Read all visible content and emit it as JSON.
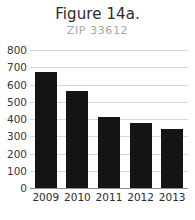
{
  "chart_data": {
    "type": "bar",
    "title": "Figure 14a.",
    "subtitle": "ZIP 33612",
    "categories": [
      "2009",
      "2010",
      "2011",
      "2012",
      "2013"
    ],
    "values": [
      670,
      560,
      410,
      375,
      340
    ],
    "xlabel": "",
    "ylabel": "",
    "ylim": [
      0,
      800
    ],
    "ytick_step": 100,
    "yticks": [
      "800",
      "700",
      "600",
      "500",
      "400",
      "300",
      "200",
      "100",
      "0"
    ],
    "grid": true,
    "legend": false,
    "series": [
      {
        "name": "ZIP 33612",
        "values": [
          670,
          560,
          410,
          375,
          340
        ]
      }
    ],
    "colors": {
      "bar": "#141414",
      "gridline": "#d8d8d8",
      "baseline": "#8f8f8f",
      "title": "#2b2b2b",
      "subtitle": "#a6a6a6",
      "tick_label": "#3a3a3a",
      "background": "#ffffff"
    }
  }
}
